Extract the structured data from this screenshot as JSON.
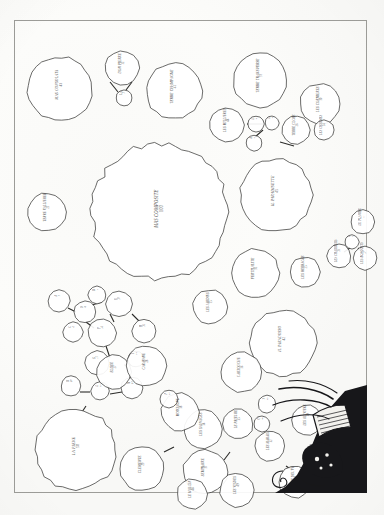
{
  "document": {
    "type": "cadastral-parcel-map",
    "medium": "engraved plate scan",
    "frame": {
      "stroke_color": "#9c9c98"
    },
    "paper_color": "#fdfdfc",
    "ink_color": "#3a3a38"
  },
  "cartouche": {
    "name": "decorative-cartouche",
    "description": "engraved scrollwork banner with foliate ornament, bottom-right corner",
    "ink_color": "#17171a"
  },
  "map_data": {
    "type": "parcel-diagram",
    "parcel_count": 52,
    "parcels": [
      {
        "label": "MAS CONSOLATA",
        "number": "43",
        "cx": 46,
        "cy": 69,
        "r": 32,
        "rot": -90,
        "font": 3.6
      },
      {
        "label": "DON PIERRE",
        "number": "12",
        "cx": 108,
        "cy": 48,
        "r": 17,
        "rot": -90,
        "font": 3.2
      },
      {
        "label": "LA",
        "number": "7",
        "cx": 110,
        "cy": 78,
        "r": 8,
        "rot": -90,
        "font": 2.8
      },
      {
        "label": "TERRE CHAMPAGNE",
        "number": "41",
        "cx": 160,
        "cy": 71,
        "r": 28,
        "rot": -90,
        "font": 3.4
      },
      {
        "label": "TERRE TRANSVERSE",
        "number": "33",
        "cx": 246,
        "cy": 60,
        "r": 27,
        "rot": -90,
        "font": 3.4
      },
      {
        "label": "LES CORNIERES",
        "number": "30",
        "cx": 306,
        "cy": 84,
        "r": 20,
        "rot": -90,
        "font": 3.2
      },
      {
        "label": "LES MILLIERES",
        "number": "44",
        "cx": 213,
        "cy": 105,
        "r": 17,
        "rot": -90,
        "font": 3.1
      },
      {
        "label": "L",
        "number": "9",
        "cx": 242,
        "cy": 104,
        "r": 8,
        "rot": -90,
        "font": 2.6
      },
      {
        "label": "L",
        "number": "8",
        "cx": 258,
        "cy": 103,
        "r": 7,
        "rot": -90,
        "font": 2.6
      },
      {
        "label": "A",
        "number": "6",
        "cx": 240,
        "cy": 123,
        "r": 8,
        "rot": -90,
        "font": 2.6
      },
      {
        "label": "TERRE CLOSE",
        "number": "26",
        "cx": 282,
        "cy": 110,
        "r": 14,
        "rot": -90,
        "font": 3.0
      },
      {
        "label": "LES CHARMES",
        "number": "24",
        "cx": 310,
        "cy": 110,
        "r": 10,
        "rot": -90,
        "font": 2.8
      },
      {
        "label": "MAS COMPOSITE",
        "number": "100",
        "cx": 146,
        "cy": 192,
        "r": 68,
        "rot": -90,
        "font": 4.6
      },
      {
        "label": "TERRE VALLIEREE",
        "number": "21",
        "cx": 33,
        "cy": 192,
        "r": 19,
        "rot": -90,
        "font": 3.1
      },
      {
        "label": "IL PARADISETTE",
        "number": "45",
        "cx": 262,
        "cy": 175,
        "r": 36,
        "rot": -90,
        "font": 3.8
      },
      {
        "label": "LE PLANIER",
        "number": "11",
        "cx": 349,
        "cy": 202,
        "r": 12,
        "rot": -90,
        "font": 2.8
      },
      {
        "label": "I",
        "number": "5",
        "cx": 338,
        "cy": 222,
        "r": 7,
        "rot": -90,
        "font": 2.5
      },
      {
        "label": "LES CHARRIERS",
        "number": "18",
        "cx": 325,
        "cy": 236,
        "r": 12,
        "rot": -90,
        "font": 2.8
      },
      {
        "label": "LES BOSQUETS",
        "number": "17",
        "cx": 351,
        "cy": 238,
        "r": 12,
        "rot": -90,
        "font": 2.8
      },
      {
        "label": "FERTILALITE",
        "number": "31",
        "cx": 241,
        "cy": 253,
        "r": 24,
        "rot": -90,
        "font": 3.3
      },
      {
        "label": "LES HERBAGES",
        "number": "25",
        "cx": 291,
        "cy": 252,
        "r": 15,
        "rot": -90,
        "font": 3.0
      },
      {
        "label": "LES JARDINS",
        "number": "15",
        "cx": 196,
        "cy": 287,
        "r": 17,
        "rot": -90,
        "font": 3.0
      },
      {
        "label": "IL PARADOSSO",
        "number": "42",
        "cx": 269,
        "cy": 323,
        "r": 33,
        "rot": -90,
        "font": 3.6
      },
      {
        "label": "A",
        "number": "3",
        "cx": 45,
        "cy": 281,
        "r": 11,
        "rot": -90,
        "font": 2.7
      },
      {
        "label": "B",
        "number": "4",
        "cx": 71,
        "cy": 292,
        "r": 11,
        "rot": -90,
        "font": 2.7
      },
      {
        "label": "C",
        "number": "2",
        "cx": 59,
        "cy": 312,
        "r": 10,
        "rot": -90,
        "font": 2.7
      },
      {
        "label": "D",
        "number": "1",
        "cx": 83,
        "cy": 275,
        "r": 9,
        "rot": -90,
        "font": 2.6
      },
      {
        "label": "E",
        "number": "10",
        "cx": 105,
        "cy": 284,
        "r": 13,
        "rot": -90,
        "font": 2.8
      },
      {
        "label": "F",
        "number": "14",
        "cx": 88,
        "cy": 313,
        "r": 14,
        "rot": -90,
        "font": 2.8
      },
      {
        "label": "G",
        "number": "13",
        "cx": 83,
        "cy": 343,
        "r": 12,
        "rot": -90,
        "font": 2.8
      },
      {
        "label": "H",
        "number": "16",
        "cx": 130,
        "cy": 311,
        "r": 12,
        "rot": -90,
        "font": 2.8
      },
      {
        "label": "I",
        "number": "19",
        "cx": 122,
        "cy": 339,
        "r": 8,
        "rot": -90,
        "font": 2.5
      },
      {
        "label": "K",
        "number": "20",
        "cx": 57,
        "cy": 366,
        "r": 10,
        "rot": -90,
        "font": 2.7
      },
      {
        "label": "L",
        "number": "22",
        "cx": 86,
        "cy": 371,
        "r": 9,
        "rot": -90,
        "font": 2.6
      },
      {
        "label": "M",
        "number": "23",
        "cx": 118,
        "cy": 368,
        "r": 11,
        "rot": -90,
        "font": 2.7
      },
      {
        "label": "ELISEE",
        "number": "27",
        "cx": 100,
        "cy": 352,
        "r": 17,
        "rot": -90,
        "font": 3.0
      },
      {
        "label": "CARAVANE",
        "number": "28",
        "cx": 132,
        "cy": 346,
        "r": 20,
        "rot": -90,
        "font": 3.1
      },
      {
        "label": "LA PIEVE",
        "number": "50",
        "cx": 62,
        "cy": 430,
        "r": 40,
        "rot": -90,
        "font": 4.0
      },
      {
        "label": "CLEMENTE",
        "number": "29",
        "cx": 128,
        "cy": 449,
        "r": 22,
        "rot": -90,
        "font": 3.2
      },
      {
        "label": "LES SAUVAGES",
        "number": "34",
        "cx": 189,
        "cy": 409,
        "r": 19,
        "rot": -90,
        "font": 3.1
      },
      {
        "label": "SEMINAIRE",
        "number": "37",
        "cx": 191,
        "cy": 452,
        "r": 22,
        "rot": -90,
        "font": 3.2
      },
      {
        "label": "MONTAGNE",
        "number": "38",
        "cx": 166,
        "cy": 392,
        "r": 19,
        "rot": -90,
        "font": 3.1
      },
      {
        "label": "CARTOUCHE",
        "number": "36",
        "cx": 227,
        "cy": 352,
        "r": 20,
        "rot": -90,
        "font": 3.1
      },
      {
        "label": "LE PRIEURE",
        "number": "35",
        "cx": 224,
        "cy": 404,
        "r": 15,
        "rot": -90,
        "font": 3.0
      },
      {
        "label": "LES MARAIS",
        "number": "32",
        "cx": 256,
        "cy": 426,
        "r": 15,
        "rot": -90,
        "font": 3.0
      },
      {
        "label": "LES OLIVIERS",
        "number": "39",
        "cx": 293,
        "cy": 400,
        "r": 15,
        "rot": -90,
        "font": 3.0
      },
      {
        "label": "N",
        "number": "40",
        "cx": 253,
        "cy": 384,
        "r": 9,
        "rot": -90,
        "font": 2.6
      },
      {
        "label": "O",
        "number": "46",
        "cx": 248,
        "cy": 404,
        "r": 8,
        "rot": -90,
        "font": 2.5
      },
      {
        "label": "P",
        "number": "47",
        "cx": 155,
        "cy": 379,
        "r": 9,
        "rot": -90,
        "font": 2.6
      },
      {
        "label": "LE MOULIN",
        "number": "48",
        "cx": 178,
        "cy": 474,
        "r": 15,
        "rot": -90,
        "font": 3.0
      },
      {
        "label": "LES VIGNES",
        "number": "49",
        "cx": 223,
        "cy": 470,
        "r": 17,
        "rot": -90,
        "font": 3.0
      },
      {
        "label": "TERRE NEUVE",
        "number": "51",
        "cx": 281,
        "cy": 462,
        "r": 16,
        "rot": -90,
        "font": 3.0
      }
    ],
    "connectors": [
      {
        "x1": 96,
        "y1": 62,
        "x2": 104,
        "y2": 72
      },
      {
        "x1": 112,
        "y1": 70,
        "x2": 118,
        "y2": 62
      },
      {
        "x1": 233,
        "y1": 104,
        "x2": 249,
        "y2": 104
      },
      {
        "x1": 249,
        "y1": 110,
        "x2": 241,
        "y2": 117
      },
      {
        "x1": 266,
        "y1": 122,
        "x2": 280,
        "y2": 126
      },
      {
        "x1": 336,
        "y1": 228,
        "x2": 330,
        "y2": 232
      },
      {
        "x1": 344,
        "y1": 228,
        "x2": 348,
        "y2": 232
      },
      {
        "x1": 54,
        "y1": 288,
        "x2": 62,
        "y2": 292
      },
      {
        "x1": 78,
        "y1": 285,
        "x2": 88,
        "y2": 282
      },
      {
        "x1": 72,
        "y1": 302,
        "x2": 80,
        "y2": 308
      },
      {
        "x1": 96,
        "y1": 294,
        "x2": 100,
        "y2": 302
      },
      {
        "x1": 118,
        "y1": 294,
        "x2": 125,
        "y2": 301
      },
      {
        "x1": 92,
        "y1": 326,
        "x2": 96,
        "y2": 338
      },
      {
        "x1": 110,
        "y1": 345,
        "x2": 118,
        "y2": 345
      },
      {
        "x1": 66,
        "y1": 372,
        "x2": 76,
        "y2": 372
      },
      {
        "x1": 96,
        "y1": 374,
        "x2": 108,
        "y2": 372
      },
      {
        "x1": 68,
        "y1": 392,
        "x2": 72,
        "y2": 386
      },
      {
        "x1": 176,
        "y1": 403,
        "x2": 182,
        "y2": 398
      },
      {
        "x1": 210,
        "y1": 440,
        "x2": 216,
        "y2": 432
      },
      {
        "x1": 272,
        "y1": 446,
        "x2": 278,
        "y2": 450
      },
      {
        "x1": 160,
        "y1": 427,
        "x2": 150,
        "y2": 432
      }
    ]
  }
}
